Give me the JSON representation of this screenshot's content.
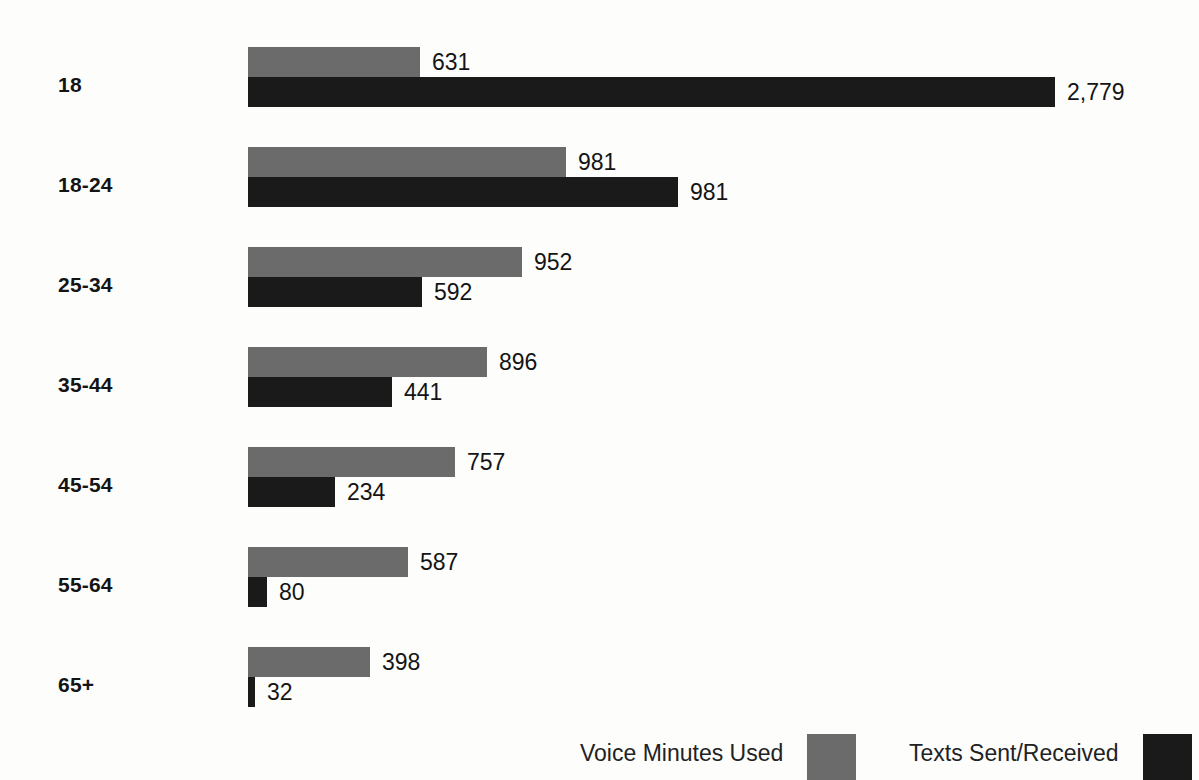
{
  "chart_data": {
    "type": "bar",
    "orientation": "horizontal",
    "title": "",
    "subtitle": "",
    "xlabel": "",
    "ylabel": "",
    "grid": false,
    "legend_position": "bottom-right",
    "xlim": [
      0,
      2779
    ],
    "categories": [
      "18",
      "18-24",
      "25-34",
      "35-44",
      "45-54",
      "55-64",
      "65+"
    ],
    "series": [
      {
        "name": "Voice Minutes Used",
        "color": "#6b6b6b",
        "values": [
          631,
          981,
          952,
          896,
          757,
          587,
          398
        ],
        "labels": [
          "631",
          "981",
          "952",
          "896",
          "757",
          "587",
          "398"
        ],
        "bar_px": [
          172,
          318,
          274,
          239,
          207,
          160,
          122
        ]
      },
      {
        "name": "Texts Sent/Received",
        "color": "#1a1a1a",
        "values": [
          2779,
          981,
          592,
          441,
          234,
          80,
          32
        ],
        "labels": [
          "2,779",
          "981",
          "592",
          "441",
          "234",
          "80",
          "32"
        ],
        "bar_px": [
          807,
          430,
          174,
          144,
          87,
          19,
          7
        ]
      }
    ]
  },
  "legend": {
    "entries": [
      {
        "label": "Voice Minutes Used",
        "swatch": "voice-swatch",
        "color": "#6b6b6b"
      },
      {
        "label": "Texts Sent/Received",
        "swatch": "texts-swatch",
        "color": "#1a1a1a"
      }
    ]
  }
}
